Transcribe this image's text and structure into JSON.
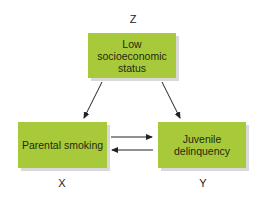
{
  "diagram": {
    "nodes": {
      "z": {
        "variable": "Z",
        "lines": [
          "Low",
          "socioeconomic",
          "status"
        ]
      },
      "x": {
        "variable": "X",
        "lines": [
          "Parental smoking"
        ]
      },
      "y": {
        "variable": "Y",
        "lines": [
          "Juvenile",
          "delinquency"
        ]
      }
    },
    "edges": [
      {
        "from": "Z",
        "to": "X",
        "direction": "one-way"
      },
      {
        "from": "Z",
        "to": "Y",
        "direction": "one-way"
      },
      {
        "from": "X",
        "to": "Y",
        "direction": "one-way"
      },
      {
        "from": "Y",
        "to": "X",
        "direction": "one-way"
      }
    ],
    "colors": {
      "box_fill": "#a8c93a",
      "box_shadow": "#d9d9d9",
      "arrow": "#222222"
    }
  }
}
